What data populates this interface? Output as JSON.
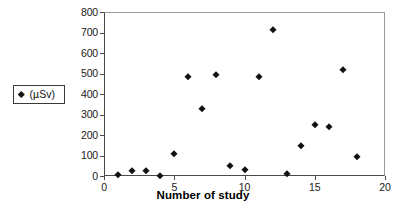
{
  "chart_data": {
    "type": "scatter",
    "title": "",
    "xlabel": "Number of study",
    "ylabel": "",
    "xlim": [
      0,
      20
    ],
    "ylim": [
      0,
      800
    ],
    "x_ticks": [
      0,
      5,
      10,
      15,
      20
    ],
    "y_ticks": [
      0,
      100,
      200,
      300,
      400,
      500,
      600,
      700,
      800
    ],
    "grid": false,
    "legend_position": "left-outside",
    "series": [
      {
        "name": "(µSv)",
        "marker": "diamond",
        "color": "#111111",
        "x": [
          1,
          2,
          3,
          4,
          5,
          6,
          7,
          8,
          9,
          10,
          11,
          12,
          13,
          14,
          15,
          16,
          17,
          18
        ],
        "values": [
          5,
          22,
          25,
          2,
          108,
          485,
          325,
          492,
          50,
          28,
          482,
          712,
          8,
          148,
          247,
          238,
          515,
          92
        ]
      }
    ]
  },
  "axes": {
    "x_tick_labels": [
      "0",
      "5",
      "10",
      "15",
      "20"
    ],
    "y_tick_labels": [
      "0",
      "100",
      "200",
      "300",
      "400",
      "500",
      "600",
      "700",
      "800"
    ],
    "x_title": "Number of study"
  },
  "legend": {
    "entries": [
      {
        "label": "(µSv)",
        "marker": "diamond-marker"
      }
    ]
  }
}
